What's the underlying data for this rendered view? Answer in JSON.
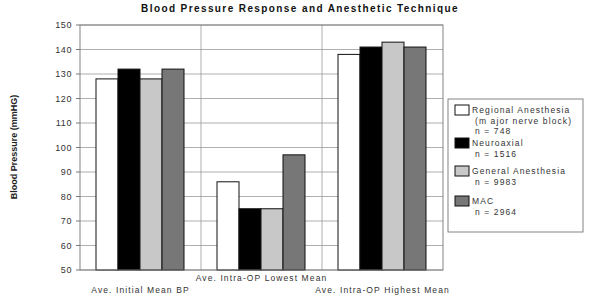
{
  "chart_data": {
    "type": "bar",
    "title": "Blood Pressure Response  and Anesthetic Technique",
    "xlabel": "",
    "ylabel": "Blood Pressure (mmHG)",
    "ylim": [
      50,
      150
    ],
    "yticks": [
      50,
      60,
      70,
      80,
      90,
      100,
      110,
      120,
      130,
      140,
      150
    ],
    "grid": true,
    "legend_position": "right",
    "categories": [
      "Ave. Initial Mean BP",
      "Ave. Intra-OP Lowest Mean",
      "Ave. Intra-OP Highest Mean"
    ],
    "series": [
      {
        "name": "Regional Anesthesia (major nerve block)",
        "n": "n = 748",
        "label_lines": [
          "Regional Anesthesia",
          "(m ajor nerve block)",
          "n = 748"
        ],
        "color": "#ffffff",
        "values": [
          128,
          86,
          138
        ]
      },
      {
        "name": "Neuroaxial",
        "n": "n = 1516",
        "label_lines": [
          "Neuroaxial",
          "n = 1516"
        ],
        "color": "#000000",
        "values": [
          132,
          75,
          141
        ]
      },
      {
        "name": "General Anesthesia",
        "n": "n = 9983",
        "label_lines": [
          "General Anesthesia",
          "n = 9983"
        ],
        "color": "#c8c8c8",
        "values": [
          128,
          75,
          143
        ]
      },
      {
        "name": "MAC",
        "n": "n = 2964",
        "label_lines": [
          "MAC",
          "n = 2964"
        ],
        "color": "#777777",
        "values": [
          132,
          97,
          141
        ]
      }
    ]
  }
}
